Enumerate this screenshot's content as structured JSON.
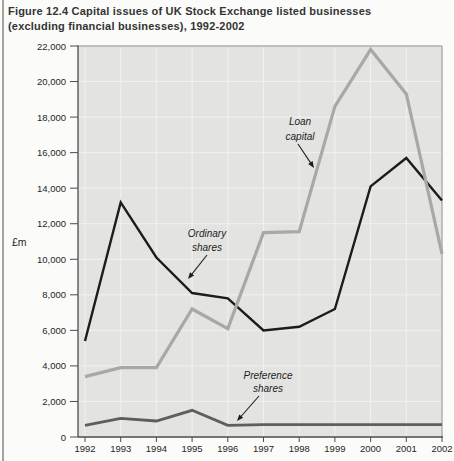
{
  "page": {
    "title_line1": "Figure 12.4  Capital issues of UK Stock Exchange listed businesses",
    "title_line2": "(excluding financial businesses), 1992-2002"
  },
  "chart_data": {
    "type": "line",
    "title": "Capital issues of UK Stock Exchange listed businesses (excluding financial businesses), 1992-2002",
    "xlabel": "",
    "ylabel": "£m",
    "x": [
      1992,
      1993,
      1994,
      1995,
      1996,
      1997,
      1998,
      1999,
      2000,
      2001,
      2002
    ],
    "ylim": [
      0,
      22000
    ],
    "ytick_step": 2000,
    "grid": true,
    "legend_position": "inline-annotations",
    "plot_bg": "#e3e3e1",
    "gridline_color": "#f1f1ef",
    "series": [
      {
        "name": "Ordinary shares",
        "color": "#1c1c1c",
        "width": 2.4,
        "values": [
          5400,
          13200,
          10100,
          8100,
          7800,
          6000,
          6200,
          7200,
          14100,
          15700,
          13300
        ]
      },
      {
        "name": "Preference shares",
        "color": "#5d5f5d",
        "width": 2.8,
        "values": [
          650,
          1050,
          900,
          1500,
          650,
          700,
          700,
          700,
          700,
          700,
          700
        ]
      },
      {
        "name": "Loan capital",
        "color": "#a6aaa4",
        "width": 3.2,
        "values": [
          3400,
          3900,
          3900,
          7200,
          6100,
          11500,
          11550,
          18600,
          21800,
          19300,
          10300
        ]
      }
    ],
    "annotations": [
      {
        "id": "loan-capital-label",
        "lines": [
          "Loan",
          "capital"
        ],
        "x": 300,
        "y": 85,
        "line_height": 15,
        "arrow": {
          "x1": 298,
          "y1": 104,
          "x2": 314,
          "y2": 128
        }
      },
      {
        "id": "ordinary-shares-label",
        "lines": [
          "Ordinary",
          "shares"
        ],
        "x": 207,
        "y": 197,
        "line_height": 14,
        "arrow": {
          "x1": 207,
          "y1": 215,
          "x2": 188,
          "y2": 239
        }
      },
      {
        "id": "preference-shares-label",
        "lines": [
          "Preference",
          "shares"
        ],
        "x": 268,
        "y": 339,
        "line_height": 13,
        "arrow": {
          "x1": 259,
          "y1": 356,
          "x2": 237,
          "y2": 381
        }
      }
    ]
  }
}
